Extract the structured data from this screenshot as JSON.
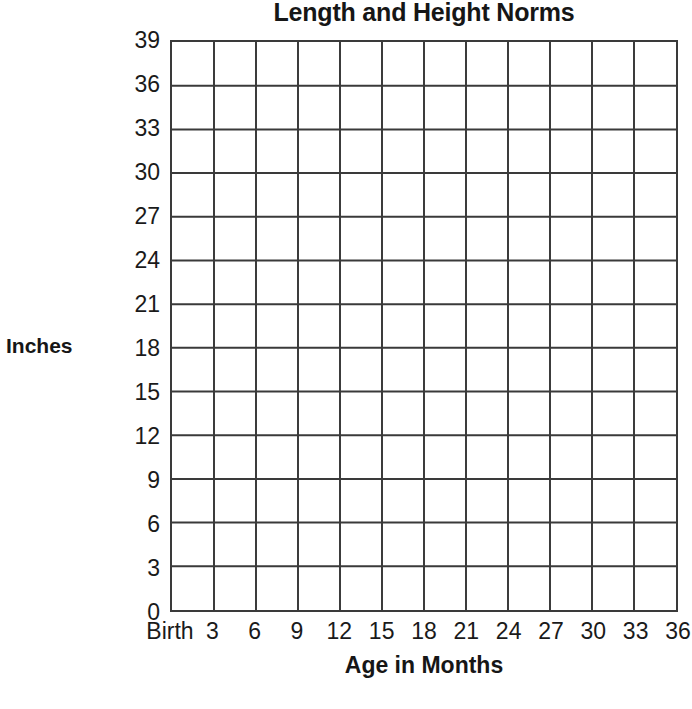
{
  "chart_data": {
    "type": "line",
    "title": "Length and Height Norms",
    "xlabel": "Age in Months",
    "ylabel": "Inches",
    "x_tick_labels": [
      "Birth",
      "3",
      "6",
      "9",
      "12",
      "15",
      "18",
      "21",
      "24",
      "27",
      "30",
      "33",
      "36"
    ],
    "x_values": [
      0,
      3,
      6,
      9,
      12,
      15,
      18,
      21,
      24,
      27,
      30,
      33,
      36
    ],
    "y_tick_labels": [
      "0",
      "3",
      "6",
      "9",
      "12",
      "15",
      "18",
      "21",
      "24",
      "27",
      "30",
      "33",
      "36",
      "39"
    ],
    "y_values": [
      0,
      3,
      6,
      9,
      12,
      15,
      18,
      21,
      24,
      27,
      30,
      33,
      36,
      39
    ],
    "xlim": [
      0,
      36
    ],
    "ylim": [
      0,
      39
    ],
    "x_tick_step": 3,
    "y_tick_step": 3,
    "grid": true,
    "grid_columns": 12,
    "grid_rows": 13,
    "legend": null,
    "series": [],
    "annotations": [],
    "note": "Blank grid template; no data series plotted",
    "colors": {
      "background": "#ffffff",
      "gridline": "#3a3a3a",
      "axis": "#3a3a3a",
      "text": "#1a1a1a"
    }
  }
}
